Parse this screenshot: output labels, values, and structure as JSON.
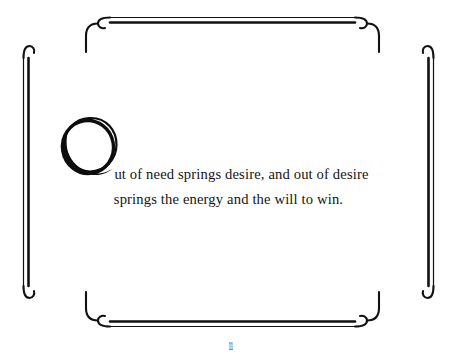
{
  "page": {
    "background_color": "#ffffff",
    "ink_color": "#111111",
    "width": 461,
    "height": 363
  },
  "frame": {
    "name": "decorative-double-rule-border",
    "style": "double-line rectangle with hooked curled corner terminations",
    "stroke_color": "#111111",
    "corners": [
      "top-left",
      "top-right",
      "bottom-left",
      "bottom-right"
    ]
  },
  "dropcap": {
    "letter": "O",
    "style": "hand-drawn brush ring with offset overlapping stroke",
    "color": "#0d0d0d"
  },
  "quote": {
    "full_text": "Out of need springs desire, and out of desire springs the energy and the will to win.",
    "lines": [
      "ut of need springs desire, and out of desire",
      "springs the energy and the will to win."
    ]
  },
  "folio": {
    "label": "11"
  }
}
